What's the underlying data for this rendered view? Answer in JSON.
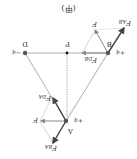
{
  "diagram": {
    "caption": "(甲)",
    "rotation_deg": 180,
    "points": {
      "A": {
        "label": "A",
        "charge": "+q"
      },
      "B": {
        "label": "B",
        "charge": "+q"
      },
      "D": {
        "label": "D",
        "charge": "−q"
      },
      "P": {
        "label": "P"
      }
    },
    "forces": {
      "on_A": [
        {
          "label": "F",
          "sub": "BA"
        },
        {
          "label": "F",
          "sub": "DA"
        },
        {
          "label": "F",
          "sub": ""
        }
      ],
      "on_B": [
        {
          "label": "F",
          "sub": "AB"
        },
        {
          "label": "F",
          "sub": "DB"
        },
        {
          "label": "F",
          "sub": ""
        }
      ]
    },
    "colors": {
      "triangle": "#b0b0b0",
      "force_arrow": "#444444",
      "resultant_arrow": "#777777",
      "construction": "#cccccc",
      "point": "#555555"
    }
  }
}
